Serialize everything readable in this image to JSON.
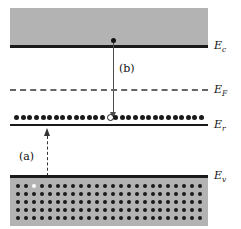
{
  "figure": {
    "background_color": "#ffffff",
    "band_fill_color": "#b3b3b3",
    "line_color": "#1a1a1a",
    "fermi_line_color": "#666666"
  },
  "levels": [
    {
      "id": "Ec",
      "symbol": "E",
      "subscript": "c",
      "label": "Ec",
      "description": "conduction band edge",
      "y": 45,
      "style": "solid"
    },
    {
      "id": "EF",
      "symbol": "E",
      "subscript": "F",
      "label": "EF",
      "description": "Fermi level",
      "y": 89,
      "style": "dashed"
    },
    {
      "id": "Er",
      "symbol": "E",
      "subscript": "r",
      "label": "Er",
      "description": "recombination/trap level",
      "y": 124,
      "style": "solid"
    },
    {
      "id": "Ev",
      "symbol": "E",
      "subscript": "v",
      "label": "Ev",
      "description": "valence band edge",
      "y": 175,
      "style": "solid"
    }
  ],
  "transitions": [
    {
      "id": "a",
      "label": "(a)",
      "direction": "up",
      "style": "dashed",
      "from": "Ev",
      "to": "Er",
      "description": "hole emission / electron capture from valence band to trap"
    },
    {
      "id": "b",
      "label": "(b)",
      "direction": "down",
      "style": "solid",
      "from": "Ec",
      "to": "Er",
      "description": "electron capture from conduction band into trap"
    }
  ],
  "carriers": {
    "conduction_electron": {
      "type": "electron",
      "fill": "filled",
      "level": "Ec"
    },
    "trap_occupancy": {
      "type": "trap-states",
      "filled_count": 28,
      "empty_count": 1,
      "empty_index": 14,
      "level": "Er"
    },
    "valence_hole": {
      "type": "hole",
      "fill": "open",
      "level": "Ev",
      "row": 0,
      "column": 2
    }
  },
  "lattice": {
    "columns": 24,
    "rows": 5,
    "dot_color": "#1a1a1a",
    "hole_color": "#ffffff"
  }
}
